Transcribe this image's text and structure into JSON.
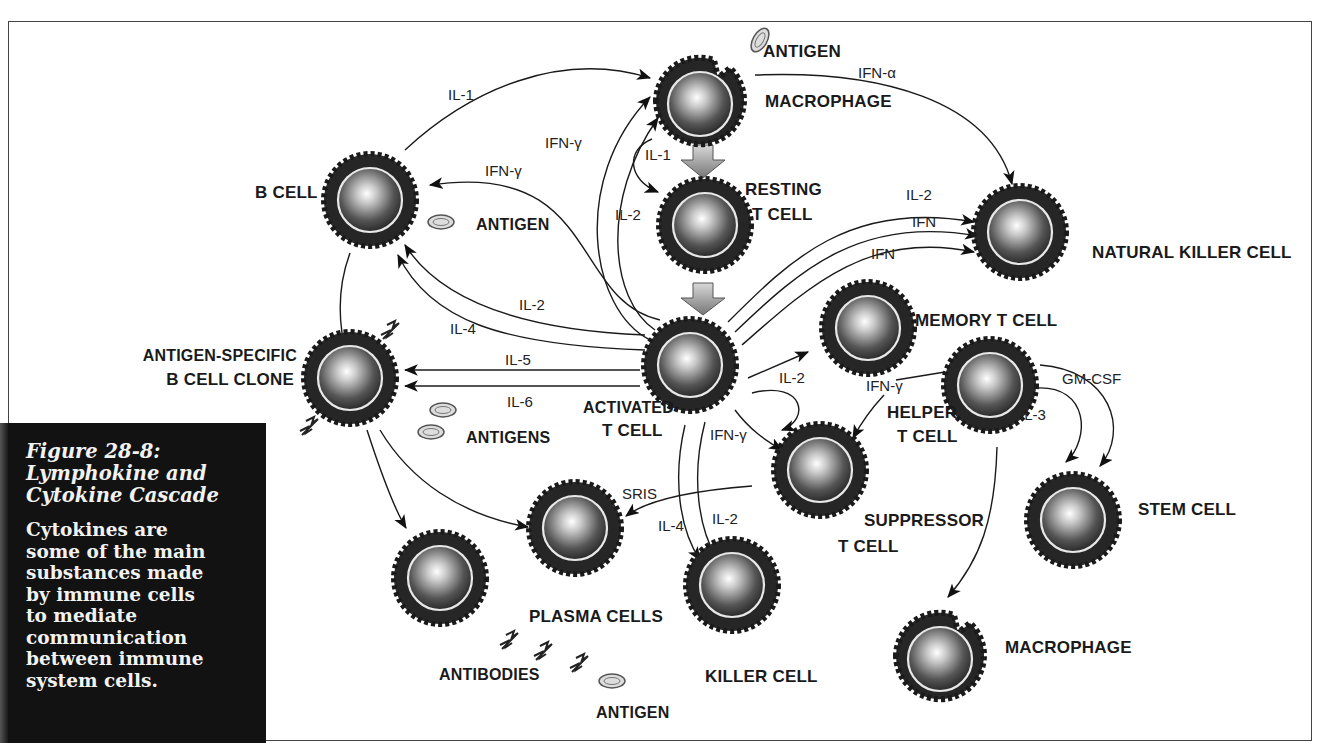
{
  "figure": {
    "number_title": "Figure 28-8:",
    "title_line2": "Lymphokine and",
    "title_line3": "Cytokine Cascade",
    "caption_lines": [
      "Cytokines are",
      "some of the main",
      "substances made",
      "by immune cells",
      "to mediate",
      "communication",
      "between immune",
      "system cells."
    ]
  },
  "cells": {
    "macrophage_top": {
      "label_a": "Antigen",
      "label_b": "Macrophage"
    },
    "resting_t": {
      "label_a": "Resting",
      "label_b": "T Cell"
    },
    "b_cell": {
      "label": "B Cell"
    },
    "b_cell_antigen": {
      "label": "Antigen"
    },
    "activated_t": {
      "label_a": "Activated",
      "label_b": "T Cell"
    },
    "ag_b_clone": {
      "label_a": "Antigen-Specific",
      "label_b": "B Cell Clone"
    },
    "antigens": {
      "label": "Antigens"
    },
    "nk": {
      "label": "Natural Killer Cell"
    },
    "memory_t": {
      "label": "Memory T Cell"
    },
    "helper_t": {
      "label_a": "Helper",
      "label_b": "T Cell"
    },
    "suppressor_t": {
      "label_a": "Suppressor",
      "label_b": "T Cell"
    },
    "stem": {
      "label": "Stem Cell"
    },
    "plasma": {
      "label": "Plasma Cells"
    },
    "killer": {
      "label": "Killer Cell"
    },
    "macrophage_bottom": {
      "label": "Macrophage"
    },
    "antibodies": {
      "label": "Antibodies"
    },
    "bottom_antigen": {
      "label": "Antigen"
    }
  },
  "cytokines": {
    "il1_b_to_mac": "IL-1",
    "ifna": "IFN-α",
    "ifng_to_mac": "IFN-γ",
    "il1_mac_to_rest": "IL-1",
    "il2_rest": "IL-2",
    "ifng_to_b": "IFN-γ",
    "il2_to_b": "IL-2",
    "il4_to_b": "IL-4",
    "il5": "IL-5",
    "il6": "IL-6",
    "nk_il2": "IL-2",
    "nk_ifn1": "IFN",
    "nk_ifn2": "IFN",
    "memory_il2": "IL-2",
    "supp_ifng": "IFN-γ",
    "helper_ifng": "IFN-γ",
    "gmcsf": "GM-CSF",
    "il3": "IL-3",
    "sris": "SRIS",
    "killer_il4": "IL-4",
    "killer_il2": "IL-2"
  }
}
